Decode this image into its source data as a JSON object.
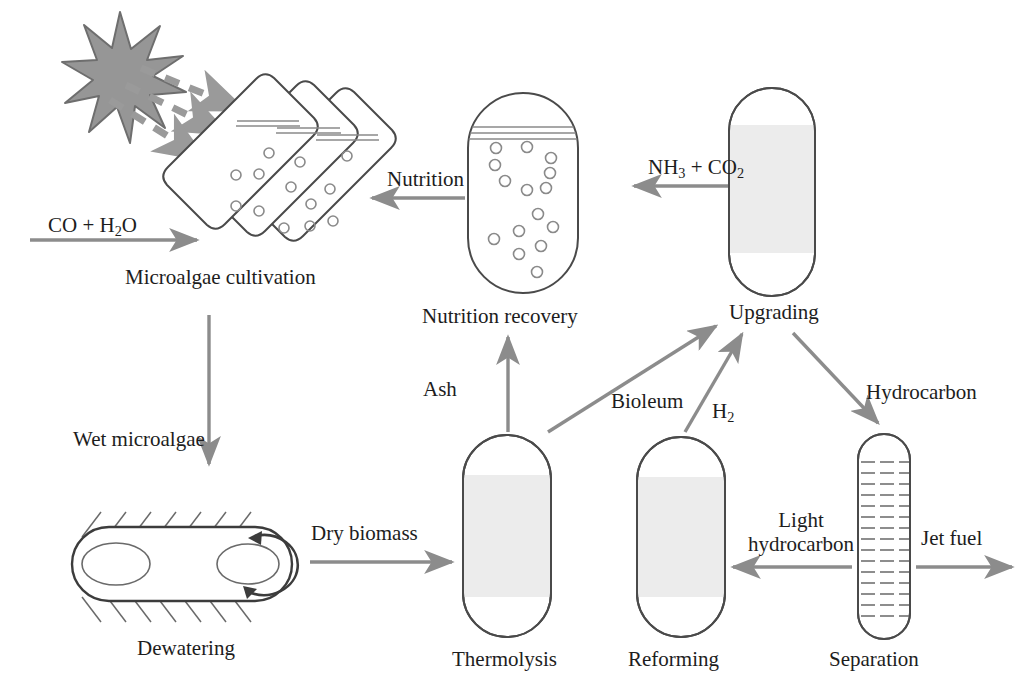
{
  "diagram": {
    "colors": {
      "outline": "#4a4a4a",
      "arrow": "#8c8c8c",
      "star_fill": "#949494",
      "star_stroke": "#6e6e6e",
      "vessel_fill": "#efefef",
      "text": "#1d1d1d",
      "background": "#ffffff"
    },
    "units": [
      {
        "id": "cultivation",
        "label": "Microalgae cultivation",
        "icon": "tilted-panel-photobioreactor",
        "panels": 3
      },
      {
        "id": "nutrition-recovery",
        "label": "Nutrition recovery",
        "icon": "capsule-vessel-with-bubbles"
      },
      {
        "id": "upgrading",
        "label": "Upgrading",
        "icon": "capsule-vessel-filled"
      },
      {
        "id": "dewatering",
        "label": "Dewatering",
        "icon": "horizontal-centrifuge"
      },
      {
        "id": "thermolysis",
        "label": "Thermolysis",
        "icon": "capsule-vessel-filled"
      },
      {
        "id": "reforming",
        "label": "Reforming",
        "icon": "capsule-vessel-filled"
      },
      {
        "id": "separation",
        "label": "Separation",
        "icon": "distillation-column-trays"
      }
    ],
    "streams": [
      {
        "id": "feed",
        "label": "CO + H",
        "sub": "2",
        "tail": "O",
        "from": "",
        "to": "cultivation"
      },
      {
        "id": "sunlight",
        "label": "",
        "from": "sun",
        "to": "cultivation"
      },
      {
        "id": "nutrition",
        "label": "Nutrition",
        "from": "nutrition-recovery",
        "to": "cultivation"
      },
      {
        "id": "nh3-co2",
        "label": "NH",
        "sub": "3",
        "mid": " + CO",
        "sub2": "2",
        "from": "upgrading",
        "to": "nutrition-recovery"
      },
      {
        "id": "wet-microalgae",
        "label": "Wet microalgae",
        "from": "cultivation",
        "to": "dewatering"
      },
      {
        "id": "dry-biomass",
        "label": "Dry biomass",
        "from": "dewatering",
        "to": "thermolysis"
      },
      {
        "id": "ash",
        "label": "Ash",
        "from": "thermolysis",
        "to": "nutrition-recovery"
      },
      {
        "id": "bioleum",
        "label": "Bioleum",
        "from": "thermolysis",
        "to": "upgrading"
      },
      {
        "id": "h2",
        "label": "H",
        "sub": "2",
        "from": "reforming",
        "to": "upgrading"
      },
      {
        "id": "hydrocarbon",
        "label": "Hydrocarbon",
        "from": "upgrading",
        "to": "separation"
      },
      {
        "id": "light-hydrocarbon",
        "label_line1": "Light",
        "label_line2": "hydrocarbon",
        "from": "separation",
        "to": "reforming"
      },
      {
        "id": "jet-fuel",
        "label": "Jet fuel",
        "from": "separation",
        "to": ""
      }
    ],
    "labels": {
      "feed": "CO + H",
      "feed_sub": "2",
      "feed_tail": "O",
      "cultivation": "Microalgae cultivation",
      "nutrition": "Nutrition",
      "nutrition_recovery": "Nutrition recovery",
      "nh3": "NH",
      "nh3_sub": "3",
      "co2_mid": " + CO",
      "co2_sub": "2",
      "upgrading": "Upgrading",
      "wet_microalgae": "Wet microalgae",
      "dewatering": "Dewatering",
      "dry_biomass": "Dry biomass",
      "ash": "Ash",
      "bioleum": "Bioleum",
      "h2": "H",
      "h2_sub": "2",
      "thermolysis": "Thermolysis",
      "reforming": "Reforming",
      "hydrocarbon": "Hydrocarbon",
      "light": "Light",
      "light_hydrocarbon": "hydrocarbon",
      "jet_fuel": "Jet fuel",
      "separation": "Separation"
    }
  }
}
